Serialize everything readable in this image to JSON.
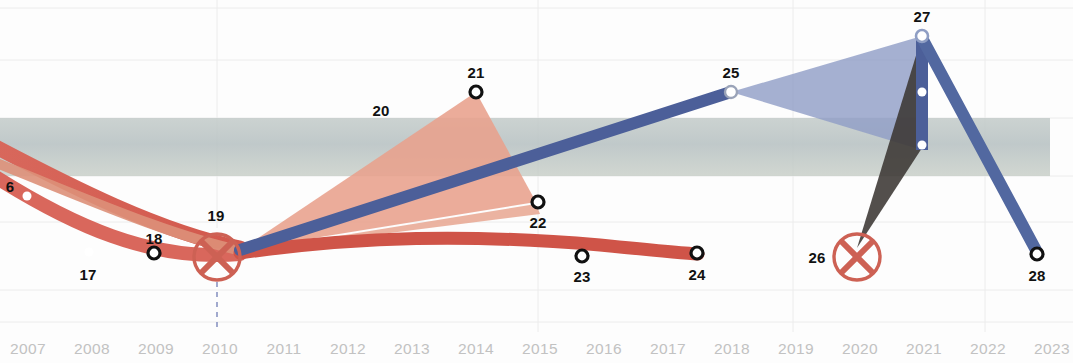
{
  "chart_data": {
    "type": "line",
    "title": "",
    "xlabel": "",
    "ylabel": "",
    "grid": true,
    "legend_position": "none",
    "xlim": [
      2007,
      2023
    ],
    "x_tick_labels": [
      "2007",
      "2008",
      "2009",
      "2010",
      "2011",
      "2012",
      "2013",
      "2014",
      "2015",
      "2016",
      "2017",
      "2018",
      "2019",
      "2020",
      "2021",
      "2022",
      "2023"
    ],
    "annotations": [
      {
        "id": "6",
        "x": 2007.0,
        "y_px": 196,
        "marker": "filled-dot",
        "label_pos": "left"
      },
      {
        "id": "17",
        "x": 2008.0,
        "y_px": 252,
        "marker": "filled-dot",
        "label_pos": "below"
      },
      {
        "id": "18",
        "x": 2009.0,
        "y_px": 253,
        "marker": "ring",
        "label_pos": "above"
      },
      {
        "id": "19",
        "x": 2010.0,
        "y_px": 257,
        "marker": "x-circle",
        "label_pos": "above"
      },
      {
        "id": "20",
        "x": 2012.4,
        "y_px": 110,
        "marker": "none",
        "label_pos": "center"
      },
      {
        "id": "21",
        "x": 2014.0,
        "y_px": 92,
        "marker": "ring",
        "label_pos": "above"
      },
      {
        "id": "22",
        "x": 2015.0,
        "y_px": 202,
        "marker": "ring",
        "label_pos": "below"
      },
      {
        "id": "23",
        "x": 2016.0,
        "y_px": 256,
        "marker": "ring",
        "label_pos": "below"
      },
      {
        "id": "24",
        "x": 2017.0,
        "y_px": 253,
        "marker": "ring",
        "label_pos": "below"
      },
      {
        "id": "25",
        "x": 2018.0,
        "y_px": 92,
        "marker": "ring-light",
        "label_pos": "above"
      },
      {
        "id": "26",
        "x": 2020.0,
        "y_px": 257,
        "marker": "x-circle",
        "label_pos": "left"
      },
      {
        "id": "27",
        "x": 2021.0,
        "y_px": 36,
        "marker": "ring-light",
        "label_pos": "above"
      },
      {
        "id": "28",
        "x": 2023.0,
        "y_px": 254,
        "marker": "ring",
        "label_pos": "below"
      }
    ],
    "series": [
      {
        "name": "red-upper-ribbon",
        "color": "#d9675c",
        "points_px": [
          [
            0,
            152
          ],
          [
            70,
            195
          ],
          [
            140,
            230
          ],
          [
            200,
            249
          ],
          [
            240,
            250
          ]
        ]
      },
      {
        "name": "red-lower-ribbon",
        "color": "#d9675c",
        "points_px": [
          [
            0,
            178
          ],
          [
            60,
            222
          ],
          [
            120,
            250
          ],
          [
            180,
            259
          ],
          [
            240,
            253
          ]
        ]
      },
      {
        "name": "red-trend-right",
        "color": "#cf5448",
        "points_px": [
          [
            240,
            252
          ],
          [
            340,
            239
          ],
          [
            450,
            235
          ],
          [
            560,
            241
          ],
          [
            640,
            249
          ],
          [
            698,
            254
          ]
        ]
      },
      {
        "name": "blue-rising-line",
        "color": "#4a5c96",
        "points_px": [
          [
            240,
            250
          ],
          [
            476,
            170
          ],
          [
            731,
            92
          ]
        ]
      },
      {
        "name": "blue-descending-line",
        "color": "#4a5c96",
        "points_px": [
          [
            922,
            36
          ],
          [
            1037,
            254
          ]
        ]
      },
      {
        "name": "blue-vertical-bar",
        "color": "#4a5c96",
        "points_px": [
          [
            922,
            36
          ],
          [
            922,
            148
          ]
        ]
      },
      {
        "name": "blue-wedge-to-x",
        "color": "#5a6ea5",
        "points_px": [
          [
            922,
            36
          ],
          [
            857,
            248
          ]
        ]
      }
    ],
    "bands": [
      {
        "name": "horizontal-reference-band",
        "color": "#b8c2c2",
        "x0_px": 0,
        "x1_px": 1050,
        "y0_px": 118,
        "y1_px": 176
      }
    ],
    "fans": [
      {
        "name": "salmon-fan",
        "color": "#e89b87",
        "apex_px": [
          240,
          250
        ],
        "edges_px": [
          [
            476,
            92
          ],
          [
            536,
            202
          ]
        ]
      },
      {
        "name": "salmon-fan-inner",
        "color": "#e2a189",
        "apex_px": [
          240,
          252
        ],
        "edges_px": [
          [
            536,
            200
          ],
          [
            540,
            210
          ]
        ]
      },
      {
        "name": "blue-fan",
        "color": "#8a99c4",
        "apex_px": [
          731,
          92
        ],
        "edges_px": [
          [
            922,
            36
          ],
          [
            922,
            148
          ]
        ]
      },
      {
        "name": "dark-wedge",
        "color": "#3a3632",
        "apex_px": [
          857,
          248
        ],
        "edges_px": [
          [
            922,
            36
          ],
          [
            922,
            148
          ]
        ]
      }
    ]
  },
  "axis": {
    "tick_color": "#c2c2c2",
    "grid_color": "#ededed"
  }
}
